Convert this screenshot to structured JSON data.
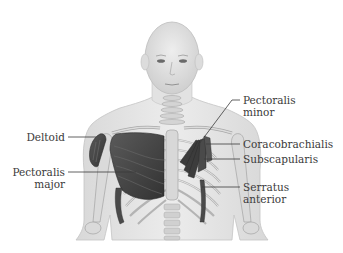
{
  "diagram": {
    "colors": {
      "background": "#ffffff",
      "skin": "#e6e6e6",
      "skin_outline": "#bdbdbd",
      "bone": "#d9d9d9",
      "bone_outline": "#a8a8a8",
      "muscle": "#4a4a4a",
      "muscle_dark": "#2f2f2f",
      "label_text": "#3a3a3a",
      "leader_line": "#3a3a3a"
    },
    "labels": [
      {
        "id": "deltoid",
        "line1": "Deltoid",
        "line2": "",
        "side": "left"
      },
      {
        "id": "pectoralis-major",
        "line1": "Pectoralis",
        "line2": "major",
        "side": "left"
      },
      {
        "id": "pectoralis-minor",
        "line1": "Pectoralis",
        "line2": "minor",
        "side": "right"
      },
      {
        "id": "coracobrachialis",
        "line1": "Coracobrachialis",
        "line2": "",
        "side": "right"
      },
      {
        "id": "subscapularis",
        "line1": "Subscapularis",
        "line2": "",
        "side": "right"
      },
      {
        "id": "serratus-anterior",
        "line1": "Serratus",
        "line2": "anterior",
        "side": "right"
      }
    ]
  }
}
